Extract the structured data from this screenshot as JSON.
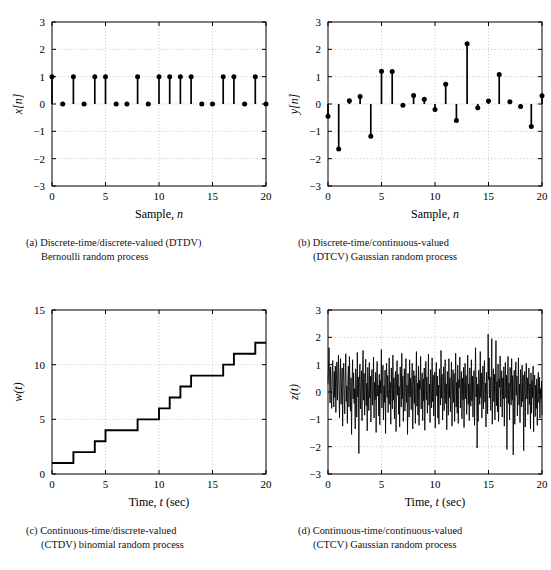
{
  "figure": {
    "background": "#ffffff",
    "line_color": "#000000",
    "grid_color": "#b4b4b4"
  },
  "panels": [
    {
      "key": "a",
      "caption_line1": "(a)  Discrete-time/discrete-valued  (DTDV)",
      "caption_line2": "Bernoulli random process",
      "ylabel": "x[n]",
      "xlabel_main": "Sample, ",
      "xlabel_italic": "n"
    },
    {
      "key": "b",
      "caption_line1": "(b)  Discrete-time/continuous-valued",
      "caption_line2": "(DTCV) Gaussian random process",
      "ylabel": "y[n]",
      "xlabel_main": "Sample, ",
      "xlabel_italic": "n"
    },
    {
      "key": "c",
      "caption_line1": "(c)  Continuous-time/discrete-valued",
      "caption_line2": "(CTDV) binomial random process",
      "ylabel": "w(t)",
      "xlabel_main": "Time, ",
      "xlabel_italic": "t",
      "xlabel_tail": " (sec)"
    },
    {
      "key": "d",
      "caption_line1": "(d)  Continuous-time/continuous-valued",
      "caption_line2": "(CTCV) Gaussian random process",
      "ylabel": "z(t)",
      "xlabel_main": "Time, ",
      "xlabel_italic": "t",
      "xlabel_tail": " (sec)"
    }
  ],
  "chart_data": [
    {
      "type": "stem",
      "panel": "a",
      "title": "",
      "xlabel": "Sample, n",
      "ylabel": "x[n]",
      "xlim": [
        0,
        20
      ],
      "ylim": [
        -3,
        3
      ],
      "xticks": [
        0,
        5,
        10,
        15,
        20
      ],
      "yticks": [
        -3,
        -2,
        -1,
        0,
        1,
        2,
        3
      ],
      "grid": true,
      "x": [
        0,
        1,
        2,
        3,
        4,
        5,
        6,
        7,
        8,
        9,
        10,
        11,
        12,
        13,
        14,
        15,
        16,
        17,
        18,
        19,
        20
      ],
      "values": [
        1,
        0,
        1,
        0,
        1,
        1,
        0,
        0,
        1,
        0,
        1,
        1,
        1,
        1,
        0,
        0,
        1,
        1,
        0,
        1,
        0
      ]
    },
    {
      "type": "stem",
      "panel": "b",
      "title": "",
      "xlabel": "Sample, n",
      "ylabel": "y[n]",
      "xlim": [
        0,
        20
      ],
      "ylim": [
        -3,
        3
      ],
      "xticks": [
        0,
        5,
        10,
        15,
        20
      ],
      "yticks": [
        -3,
        -2,
        -1,
        0,
        1,
        2,
        3
      ],
      "grid": true,
      "x": [
        0,
        1,
        2,
        3,
        4,
        5,
        6,
        7,
        8,
        9,
        10,
        11,
        12,
        13,
        14,
        15,
        16,
        17,
        18,
        19,
        20
      ],
      "values": [
        -0.45,
        -1.65,
        0.12,
        0.27,
        -1.18,
        1.2,
        1.19,
        -0.05,
        0.31,
        0.17,
        -0.2,
        0.72,
        -0.6,
        2.2,
        -0.14,
        0.11,
        1.08,
        0.08,
        -0.09,
        -0.82,
        0.3
      ]
    },
    {
      "type": "step",
      "panel": "c",
      "title": "",
      "xlabel": "Time, t (sec)",
      "ylabel": "w(t)",
      "xlim": [
        0,
        20
      ],
      "ylim": [
        0,
        15
      ],
      "xticks": [
        0,
        5,
        10,
        15,
        20
      ],
      "yticks": [
        0,
        5,
        10,
        15
      ],
      "grid": true,
      "x": [
        0,
        1,
        2,
        3,
        4,
        5,
        6,
        7,
        8,
        9,
        10,
        11,
        12,
        13,
        14,
        15,
        16,
        17,
        18,
        19,
        20
      ],
      "values": [
        1,
        1,
        2,
        2,
        3,
        4,
        4,
        4,
        5,
        5,
        6,
        7,
        8,
        9,
        9,
        9,
        10,
        11,
        11,
        12,
        12
      ]
    },
    {
      "type": "line",
      "panel": "d",
      "title": "",
      "xlabel": "Time, t (sec)",
      "ylabel": "z(t)",
      "xlim": [
        0,
        20
      ],
      "ylim": [
        -3,
        3
      ],
      "xticks": [
        0,
        5,
        10,
        15,
        20
      ],
      "yticks": [
        -3,
        -2,
        -1,
        0,
        1,
        2,
        3
      ],
      "grid": true,
      "description": "dense continuous-time white Gaussian noise, zero mean, approx unit std, observed range -2.3 to 2.1",
      "n_points": 400,
      "values": [
        0.3,
        1.0,
        1.62,
        0.55,
        -0.4,
        0.92,
        0.1,
        -0.6,
        0.44,
        1.15,
        0.2,
        -0.55,
        0.75,
        -0.2,
        0.95,
        -0.75,
        0.35,
        1.1,
        -0.3,
        0.6,
        1.35,
        0.05,
        -0.95,
        0.5,
        1.22,
        -0.45,
        0.15,
        0.88,
        -1.25,
        0.4,
        1.05,
        -0.1,
        -0.8,
        0.62,
        1.4,
        -0.35,
        0.22,
        -1.15,
        0.48,
        0.95,
        -0.55,
        1.3,
        0.08,
        -0.7,
        0.52,
        -1.55,
        0.3,
        1.18,
        -0.25,
        0.7,
        -0.42,
        0.12,
        -1.35,
        0.85,
        0.28,
        -0.92,
        1.45,
        -0.18,
        0.55,
        -2.25,
        0.38,
        1.02,
        -0.62,
        0.2,
        0.78,
        -1.05,
        0.45,
        1.52,
        -0.3,
        0.68,
        -0.85,
        0.14,
        1.2,
        -0.5,
        0.32,
        -1.42,
        0.9,
        0.05,
        -0.68,
        1.08,
        -0.22,
        0.58,
        -1.1,
        0.4,
        0.82,
        -0.48,
        0.18,
        1.28,
        -0.95,
        0.35,
        -0.28,
        0.72,
        -1.48,
        0.5,
        1.12,
        -0.15,
        0.25,
        -0.88,
        0.65,
        -1.2,
        0.42,
        -0.05,
        1.55,
        -0.58,
        0.3,
        0.98,
        -1.02,
        0.22,
        -0.38,
        0.8,
        -1.52,
        0.48,
        1.05,
        -0.2,
        0.6,
        -0.75,
        0.12,
        1.25,
        -0.45,
        0.35,
        -1.18,
        0.88,
        0.08,
        -0.62,
        1.35,
        -0.3,
        0.52,
        -0.98,
        0.28,
        0.75,
        -1.45,
        0.4,
        1.15,
        -0.12,
        0.65,
        -0.82,
        0.2,
        -1.28,
        0.92,
        0.32,
        -0.55,
        1.42,
        -0.25,
        0.58,
        -1.08,
        0.15,
        0.85,
        -0.7,
        0.45,
        1.22,
        -0.38,
        0.25,
        -1.55,
        0.68,
        0.02,
        -0.92,
        1.18,
        -0.18,
        0.5,
        -0.65,
        0.38,
        1.05,
        -1.35,
        0.28,
        0.78,
        -0.42,
        0.6,
        -1.15,
        0.18,
        1.48,
        -0.52,
        0.32,
        -0.85,
        0.95,
        -1.22,
        0.42,
        0.1,
        1.3,
        -0.62,
        0.22,
        0.7,
        -1.05,
        0.48,
        -0.32,
        0.88,
        -1.4,
        0.35,
        1.12,
        -0.28,
        0.55,
        -0.78,
        0.15,
        1.38,
        -0.48,
        0.28,
        -1.12,
        0.82,
        0.05,
        -0.58,
        1.25,
        -0.35,
        0.62,
        -0.88,
        0.2,
        0.72,
        -1.32,
        0.45,
        1.08,
        -0.15,
        0.58,
        -0.95,
        0.25,
        -1.18,
        0.85,
        0.3,
        -0.48,
        1.52,
        -0.22,
        0.65,
        -1.02,
        0.12,
        0.92,
        -0.68,
        0.4,
        1.18,
        -0.42,
        0.3,
        -1.38,
        0.75,
        0.08,
        -0.85,
        1.22,
        -0.2,
        0.52,
        -0.72,
        0.35,
        1.1,
        -1.25,
        0.25,
        0.82,
        -0.38,
        0.68,
        -1.08,
        0.22,
        1.42,
        -0.55,
        0.35,
        -0.78,
        0.98,
        -1.15,
        0.45,
        0.15,
        1.28,
        -0.58,
        0.2,
        0.75,
        -0.98,
        0.5,
        -0.28,
        0.9,
        -1.3,
        0.38,
        1.05,
        -0.25,
        0.6,
        -0.82,
        0.18,
        1.35,
        -0.45,
        0.3,
        -1.05,
        0.88,
        0.1,
        -0.52,
        1.18,
        -0.32,
        0.58,
        -0.92,
        0.22,
        0.78,
        -1.22,
        0.42,
        1.62,
        -0.18,
        0.55,
        -2.05,
        0.28,
        -1.08,
        0.8,
        0.35,
        -0.45,
        1.48,
        -0.2,
        0.7,
        -0.95,
        0.15,
        0.95,
        -0.62,
        0.42,
        1.15,
        -0.38,
        0.32,
        -1.28,
        0.72,
        0.05,
        -0.8,
        2.12,
        0.45,
        1.25,
        -0.22,
        0.55,
        -0.68,
        0.38,
        1.95,
        -1.18,
        0.28,
        0.85,
        -0.35,
        0.65,
        -1.02,
        0.25,
        1.88,
        -0.5,
        0.38,
        -0.72,
        1.02,
        -1.08,
        0.48,
        0.18,
        1.32,
        -0.55,
        0.22,
        0.78,
        -0.92,
        0.52,
        -0.25,
        0.92,
        -1.25,
        0.4,
        1.08,
        -0.22,
        0.62,
        -2.1,
        0.2,
        1.3,
        -0.42,
        0.32,
        -1.02,
        0.9,
        0.12,
        -0.48,
        1.22,
        -0.3,
        0.6,
        -2.3,
        0.25,
        0.8,
        -1.18,
        0.45,
        1.1,
        -0.12,
        0.58,
        -0.88,
        0.2,
        1.25,
        -0.48,
        0.28,
        -1.12,
        0.82,
        0.08,
        -0.55,
        0.98,
        -0.35,
        0.62,
        -2.15,
        0.18,
        0.75,
        -1.28,
        0.4,
        1.05,
        -0.25,
        0.52,
        -0.82,
        0.15,
        0.88,
        -0.45,
        0.3,
        -1.35,
        0.7,
        -0.78,
        0.42,
        -0.2,
        0.95,
        -1.45,
        0.35,
        0.62,
        -0.9,
        0.25,
        -0.6,
        0.48,
        -1.22,
        0.18,
        0.72,
        -0.38,
        0.55,
        -0.95,
        0.12,
        -0.25,
        0.4,
        -0.85
      ]
    }
  ]
}
